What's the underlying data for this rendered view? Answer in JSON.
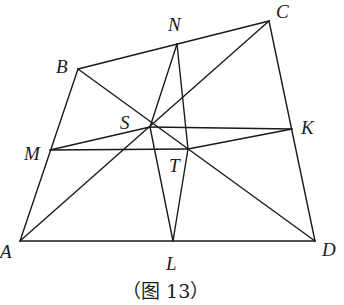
{
  "figure": {
    "caption": "（图 13）",
    "points": {
      "A": {
        "label": "A",
        "x": 20,
        "y": 241
      },
      "B": {
        "label": "B",
        "x": 78,
        "y": 69
      },
      "C": {
        "label": "C",
        "x": 269,
        "y": 21
      },
      "D": {
        "label": "D",
        "x": 315,
        "y": 241
      },
      "N": {
        "label": "N",
        "x": 177,
        "y": 44
      },
      "L": {
        "label": "L",
        "x": 173,
        "y": 241
      },
      "M": {
        "label": "M",
        "x": 50,
        "y": 150
      },
      "K": {
        "label": "K",
        "x": 292,
        "y": 129
      },
      "S": {
        "label": "S",
        "x": 150,
        "y": 127
      },
      "T": {
        "label": "T",
        "x": 188,
        "y": 149
      }
    },
    "segments": [
      [
        "A",
        "B"
      ],
      [
        "B",
        "C"
      ],
      [
        "C",
        "D"
      ],
      [
        "D",
        "A"
      ],
      [
        "A",
        "C"
      ],
      [
        "B",
        "D"
      ],
      [
        "M",
        "S"
      ],
      [
        "S",
        "K"
      ],
      [
        "M",
        "T"
      ],
      [
        "T",
        "K"
      ],
      [
        "N",
        "S"
      ],
      [
        "N",
        "T"
      ],
      [
        "S",
        "L"
      ],
      [
        "T",
        "L"
      ]
    ]
  }
}
